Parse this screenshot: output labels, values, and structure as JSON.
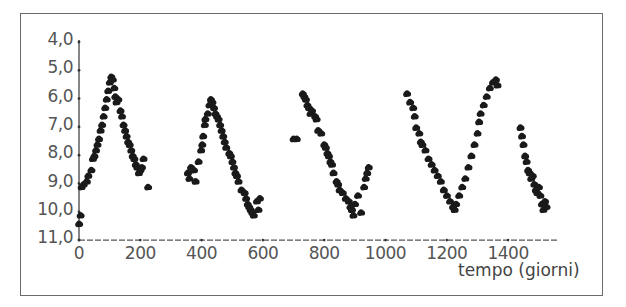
{
  "chart_data": {
    "type": "scatter",
    "title": "",
    "xlabel": "tempo (giorni)",
    "ylabel": "",
    "xlim": [
      0,
      1560
    ],
    "ylim": [
      11.0,
      4.0
    ],
    "y_inverted": true,
    "grid": false,
    "legend": null,
    "x_ticks": [
      "0",
      "200",
      "400",
      "600",
      "800",
      "1000",
      "1200",
      "1400"
    ],
    "x_tick_values": [
      0,
      200,
      400,
      600,
      800,
      1000,
      1200,
      1400
    ],
    "y_ticks": [
      "4,0",
      "5,0",
      "6,0",
      "7,0",
      "8,0",
      "9,0",
      "10,0",
      "11,0"
    ],
    "y_tick_values": [
      4,
      5,
      6,
      7,
      8,
      9,
      10,
      11
    ],
    "series": [
      {
        "name": "ciclo 1",
        "points": [
          [
            0,
            10.4
          ],
          [
            5,
            10.1
          ],
          [
            8,
            9.1
          ],
          [
            15,
            9.0
          ],
          [
            25,
            8.9
          ],
          [
            30,
            8.7
          ],
          [
            40,
            8.5
          ],
          [
            45,
            8.1
          ],
          [
            50,
            8.0
          ],
          [
            55,
            7.8
          ],
          [
            60,
            7.6
          ],
          [
            65,
            7.4
          ],
          [
            70,
            7.1
          ],
          [
            75,
            6.9
          ],
          [
            80,
            6.6
          ],
          [
            85,
            6.3
          ],
          [
            90,
            6.0
          ],
          [
            95,
            5.7
          ],
          [
            100,
            5.4
          ],
          [
            105,
            5.2
          ],
          [
            110,
            5.3
          ],
          [
            115,
            5.6
          ],
          [
            118,
            5.9
          ],
          [
            122,
            6.1
          ],
          [
            128,
            6.0
          ],
          [
            135,
            6.4
          ],
          [
            140,
            6.6
          ],
          [
            145,
            6.9
          ],
          [
            150,
            7.1
          ],
          [
            155,
            7.3
          ],
          [
            160,
            7.5
          ],
          [
            165,
            7.6
          ],
          [
            170,
            7.8
          ],
          [
            175,
            8.0
          ],
          [
            180,
            8.1
          ],
          [
            185,
            8.3
          ],
          [
            190,
            8.4
          ],
          [
            195,
            8.6
          ],
          [
            200,
            8.5
          ],
          [
            205,
            8.4
          ],
          [
            210,
            8.1
          ],
          [
            225,
            9.1
          ]
        ]
      },
      {
        "name": "ciclo 2",
        "points": [
          [
            355,
            8.6
          ],
          [
            360,
            8.8
          ],
          [
            365,
            8.4
          ],
          [
            375,
            8.5
          ],
          [
            380,
            8.9
          ],
          [
            390,
            8.2
          ],
          [
            398,
            7.8
          ],
          [
            402,
            7.6
          ],
          [
            405,
            7.3
          ],
          [
            410,
            6.9
          ],
          [
            412,
            6.7
          ],
          [
            420,
            6.5
          ],
          [
            425,
            6.2
          ],
          [
            430,
            6.0
          ],
          [
            435,
            6.1
          ],
          [
            440,
            6.3
          ],
          [
            445,
            6.5
          ],
          [
            450,
            6.6
          ],
          [
            455,
            6.7
          ],
          [
            460,
            6.9
          ],
          [
            465,
            7.1
          ],
          [
            470,
            7.3
          ],
          [
            475,
            7.5
          ],
          [
            480,
            7.7
          ],
          [
            490,
            7.9
          ],
          [
            495,
            8.0
          ],
          [
            500,
            8.2
          ],
          [
            505,
            8.4
          ],
          [
            510,
            8.6
          ],
          [
            515,
            8.7
          ],
          [
            520,
            8.9
          ],
          [
            530,
            9.2
          ],
          [
            540,
            9.3
          ],
          [
            545,
            9.5
          ],
          [
            550,
            9.7
          ],
          [
            555,
            9.8
          ],
          [
            560,
            9.9
          ],
          [
            565,
            10.0
          ],
          [
            570,
            10.1
          ],
          [
            580,
            9.6
          ],
          [
            585,
            9.9
          ],
          [
            590,
            9.5
          ]
        ]
      },
      {
        "name": "ciclo 3",
        "points": [
          [
            700,
            7.4
          ],
          [
            710,
            7.4
          ],
          [
            730,
            5.8
          ],
          [
            735,
            5.9
          ],
          [
            740,
            6.0
          ],
          [
            745,
            6.2
          ],
          [
            750,
            6.3
          ],
          [
            755,
            6.5
          ],
          [
            760,
            6.4
          ],
          [
            770,
            6.6
          ],
          [
            775,
            6.7
          ],
          [
            780,
            7.1
          ],
          [
            790,
            7.2
          ],
          [
            800,
            7.6
          ],
          [
            805,
            7.7
          ],
          [
            810,
            7.9
          ],
          [
            815,
            8.0
          ],
          [
            820,
            8.2
          ],
          [
            825,
            8.3
          ],
          [
            830,
            8.6
          ],
          [
            840,
            8.9
          ],
          [
            845,
            9.0
          ],
          [
            850,
            9.2
          ],
          [
            860,
            9.3
          ],
          [
            870,
            9.5
          ],
          [
            880,
            9.6
          ],
          [
            885,
            9.8
          ],
          [
            890,
            9.9
          ],
          [
            895,
            10.1
          ],
          [
            900,
            9.7
          ],
          [
            910,
            9.4
          ],
          [
            920,
            10.0
          ],
          [
            930,
            9.1
          ],
          [
            935,
            8.8
          ],
          [
            940,
            8.6
          ],
          [
            945,
            8.4
          ]
        ]
      },
      {
        "name": "ciclo 4",
        "points": [
          [
            1070,
            5.8
          ],
          [
            1080,
            6.1
          ],
          [
            1090,
            6.3
          ],
          [
            1095,
            6.6
          ],
          [
            1100,
            7.0
          ],
          [
            1110,
            7.2
          ],
          [
            1115,
            7.5
          ],
          [
            1120,
            7.6
          ],
          [
            1130,
            7.8
          ],
          [
            1140,
            8.1
          ],
          [
            1150,
            8.3
          ],
          [
            1160,
            8.5
          ],
          [
            1170,
            8.7
          ],
          [
            1180,
            8.9
          ],
          [
            1190,
            9.2
          ],
          [
            1200,
            9.4
          ],
          [
            1210,
            9.6
          ],
          [
            1220,
            9.8
          ],
          [
            1225,
            9.9
          ],
          [
            1230,
            9.7
          ],
          [
            1240,
            9.4
          ],
          [
            1250,
            9.1
          ],
          [
            1260,
            8.8
          ],
          [
            1270,
            8.4
          ],
          [
            1280,
            8.0
          ],
          [
            1290,
            7.6
          ],
          [
            1300,
            7.2
          ],
          [
            1305,
            6.8
          ],
          [
            1310,
            6.5
          ],
          [
            1320,
            6.2
          ],
          [
            1330,
            5.9
          ],
          [
            1340,
            5.6
          ],
          [
            1350,
            5.4
          ],
          [
            1360,
            5.3
          ],
          [
            1365,
            5.5
          ]
        ]
      },
      {
        "name": "ciclo 5",
        "points": [
          [
            1440,
            7.0
          ],
          [
            1445,
            7.3
          ],
          [
            1450,
            7.6
          ],
          [
            1455,
            8.0
          ],
          [
            1460,
            8.2
          ],
          [
            1465,
            8.5
          ],
          [
            1470,
            8.6
          ],
          [
            1475,
            8.8
          ],
          [
            1480,
            8.7
          ],
          [
            1485,
            9.0
          ],
          [
            1490,
            9.2
          ],
          [
            1495,
            9.3
          ],
          [
            1500,
            9.1
          ],
          [
            1505,
            9.4
          ],
          [
            1510,
            9.7
          ],
          [
            1515,
            9.9
          ],
          [
            1520,
            9.6
          ],
          [
            1525,
            9.8
          ]
        ]
      }
    ],
    "annotations": []
  }
}
